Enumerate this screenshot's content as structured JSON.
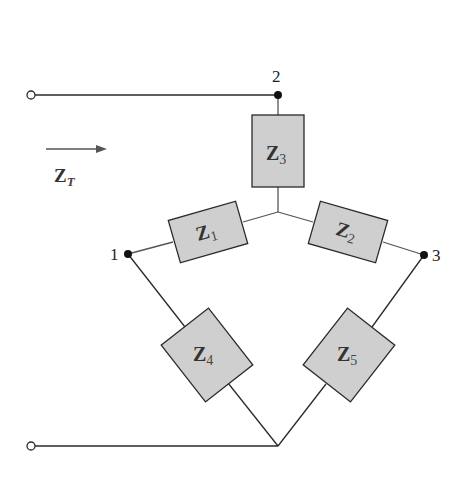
{
  "diagram": {
    "type": "circuit",
    "input_impedance": {
      "symbol": "Z",
      "subscript": "T"
    },
    "nodes": [
      {
        "id": "1",
        "label": "1"
      },
      {
        "id": "2",
        "label": "2"
      },
      {
        "id": "3",
        "label": "3"
      }
    ],
    "impedances": [
      {
        "symbol": "Z",
        "subscript": "1",
        "between": [
          "1",
          "center"
        ]
      },
      {
        "symbol": "Z",
        "subscript": "2",
        "between": [
          "center",
          "3"
        ]
      },
      {
        "symbol": "Z",
        "subscript": "3",
        "between": [
          "2",
          "center"
        ]
      },
      {
        "symbol": "Z",
        "subscript": "4",
        "between": [
          "1",
          "bottom"
        ]
      },
      {
        "symbol": "Z",
        "subscript": "5",
        "between": [
          "3",
          "bottom"
        ]
      }
    ],
    "colors": {
      "wire": "#2a2a2a",
      "box_fill": "#cfcfcf",
      "text": "#333333"
    }
  }
}
